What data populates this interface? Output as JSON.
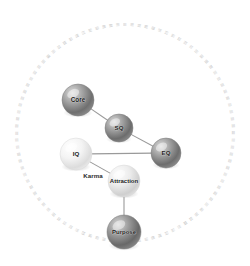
{
  "diagram": {
    "canvas": {
      "width": 250,
      "height": 266,
      "background": "#ffffff"
    },
    "ring": {
      "name": "decorative-text-ring",
      "center_x": 125,
      "center_y": 133,
      "radius": 108,
      "tick_count": 96,
      "tick_glyph": "≡",
      "color": "#b9b9b9",
      "legible": false
    },
    "nodes": [
      {
        "id": "core",
        "label": "Core",
        "cx": 78,
        "cy": 100,
        "r": 16,
        "tone": "dark",
        "fill_light": "#d8d8d8",
        "fill_mid": "#9b9b9b",
        "fill_dark": "#5e5e5e",
        "font_size": 6.4
      },
      {
        "id": "sq",
        "label": "SQ",
        "cx": 119,
        "cy": 128,
        "r": 14,
        "tone": "dark",
        "fill_light": "#d4d4d4",
        "fill_mid": "#989898",
        "fill_dark": "#5c5c5c",
        "font_size": 6.2
      },
      {
        "id": "eq",
        "label": "EQ",
        "cx": 166,
        "cy": 153,
        "r": 15,
        "tone": "dark",
        "fill_light": "#d6d6d6",
        "fill_mid": "#9a9a9a",
        "fill_dark": "#5d5d5d",
        "font_size": 6.2
      },
      {
        "id": "iq",
        "label": "IQ",
        "cx": 76,
        "cy": 154,
        "r": 16,
        "tone": "light",
        "fill_light": "#ffffff",
        "fill_mid": "#f0f0f0",
        "fill_dark": "#d2d2d2",
        "font_size": 6.2
      },
      {
        "id": "attraction",
        "label": "Attraction",
        "cx": 124,
        "cy": 181,
        "r": 16,
        "tone": "light",
        "fill_light": "#fbfbfb",
        "fill_mid": "#e7e7e7",
        "fill_dark": "#c4c4c4",
        "font_size": 6.0
      },
      {
        "id": "purpose",
        "label": "Purpose",
        "cx": 124,
        "cy": 232,
        "r": 17,
        "tone": "dark",
        "fill_light": "#d3d3d3",
        "fill_mid": "#959595",
        "fill_dark": "#595959",
        "font_size": 6.0
      }
    ],
    "edges": [
      {
        "id": "core-sq",
        "from": "core",
        "to": "sq",
        "label": ""
      },
      {
        "id": "sq-eq",
        "from": "sq",
        "to": "eq",
        "label": ""
      },
      {
        "id": "iq-eq",
        "from": "iq",
        "to": "eq",
        "label": ""
      },
      {
        "id": "iq-attraction",
        "from": "iq",
        "to": "attraction",
        "label": "Karma"
      },
      {
        "id": "attraction-purpose",
        "from": "attraction",
        "to": "purpose",
        "label": ""
      }
    ],
    "edge_labels": [
      {
        "id": "karma",
        "text": "Karma",
        "x": 93,
        "y": 176,
        "font_size": 6.2
      }
    ],
    "colors": {
      "edge": "#9a9a9a",
      "ring": "#b9b9b9",
      "label": "#1d1d1d",
      "background": "#ffffff"
    }
  }
}
